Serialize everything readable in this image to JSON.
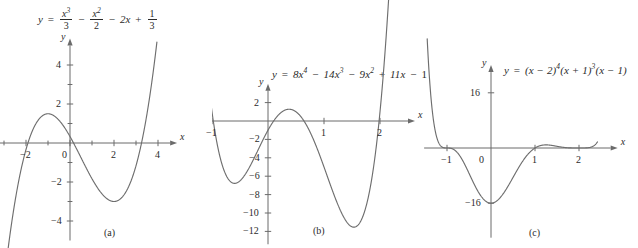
{
  "figure": {
    "background_color": "#ffffff",
    "curve_color": "#6e6e6e",
    "axis_color": "#6b6b6b",
    "text_color": "#2b2b2b"
  },
  "panels": [
    {
      "caption": "(a)",
      "equation_parts": {
        "y": "y",
        "eq": "=",
        "t1_num": "x",
        "t1_exp": "3",
        "t1_den": "3",
        "minus1": "−",
        "t2_num": "x",
        "t2_exp": "2",
        "t2_den": "2",
        "minus2": "−",
        "t3": "2x",
        "plus": "+",
        "t4_num": "1",
        "t4_den": "3"
      },
      "x_axis_label": "x",
      "y_axis_label": "y",
      "x_ticks": [
        "−4",
        "−2",
        "0",
        "2",
        "4"
      ],
      "y_ticks": [
        "4",
        "2",
        "−2",
        "−4"
      ]
    },
    {
      "caption": "(b)",
      "equation_parts": {
        "y": "y",
        "eq": "=",
        "t1": "8x",
        "t1_exp": "4",
        "minus1": "−",
        "t2": "14x",
        "t2_exp": "3",
        "minus2": "−",
        "t3": "9x",
        "t3_exp": "2",
        "plus": "+",
        "t4": "11x",
        "minus3": "−",
        "t5": "1"
      },
      "x_axis_label": "x",
      "y_axis_label": "y",
      "x_ticks": [
        "−1",
        "1",
        "2"
      ],
      "y_ticks": [
        "2",
        "−2",
        "−4",
        "−6",
        "−8",
        "−10",
        "−12"
      ]
    },
    {
      "caption": "(c)",
      "equation_parts": {
        "y": "y",
        "eq": "=",
        "f1": "(x − 2)",
        "f1_exp": "4",
        "f2": "(x + 1)",
        "f2_exp": "3",
        "f3": "(x − 1)"
      },
      "x_axis_label": "x",
      "y_axis_label": "y",
      "x_ticks": [
        "−1",
        "0",
        "1",
        "2"
      ],
      "y_ticks": [
        "16",
        "−16"
      ]
    }
  ],
  "chart_data": [
    {
      "type": "line",
      "title": "y = x³/3 − x²/2 − 2x + 1/3",
      "xlabel": "x",
      "ylabel": "y",
      "xlim": [
        -4.6,
        4.6
      ],
      "ylim": [
        -5.0,
        5.0
      ],
      "grid": false,
      "legend": "none",
      "xticks": [
        -4,
        -2,
        0,
        2,
        4
      ],
      "yticks": [
        4,
        2,
        -2,
        -4
      ],
      "minor_xticks": [
        -3,
        -1,
        1,
        3
      ],
      "minor_yticks": [
        3,
        1,
        -1,
        -3
      ],
      "poly_coeffs_desc": [
        0.3333333,
        -0.5,
        -2.0,
        0.3333333
      ],
      "x_domain_drawn": [
        -3.35,
        3.95
      ],
      "features": {
        "local_max": {
          "x": -1.0,
          "y": 1.5
        },
        "local_min": {
          "x": 2.0,
          "y": -3.0
        }
      }
    },
    {
      "type": "line",
      "title": "y = 8x⁴ − 14x³ − 9x² + 11x − 1",
      "xlabel": "x",
      "ylabel": "y",
      "xlim": [
        -1.25,
        2.55
      ],
      "ylim": [
        -13.5,
        3.5
      ],
      "grid": false,
      "legend": "none",
      "xticks": [
        -1,
        1,
        2
      ],
      "yticks": [
        2,
        -2,
        -4,
        -6,
        -8,
        -10,
        -12
      ],
      "poly_coeffs_desc": [
        8,
        -14,
        -9,
        11,
        -1
      ],
      "x_domain_drawn": [
        -1.12,
        2.22
      ],
      "features": {
        "local_min_left": {
          "x": -0.78,
          "y": -6.7
        },
        "local_max_mid": {
          "x": 0.42,
          "y": 1.45
        },
        "local_min_right": {
          "x": 1.66,
          "y": -11.4
        }
      }
    },
    {
      "type": "line",
      "title": "y = (x − 2)⁴(x + 1)³(x − 1)",
      "xlabel": "x",
      "ylabel": "y",
      "xlim": [
        -1.65,
        2.75
      ],
      "ylim": [
        -26,
        26
      ],
      "grid": false,
      "legend": "none",
      "xticks": [
        -1,
        0,
        1,
        2
      ],
      "yticks": [
        16,
        -16
      ],
      "roots": [
        {
          "x": -1,
          "multiplicity": 3
        },
        {
          "x": 1,
          "multiplicity": 1
        },
        {
          "x": 2,
          "multiplicity": 4
        }
      ],
      "factors": "(x-2)^4 * (x+1)^3 * (x-1)",
      "x_domain_drawn": [
        -1.45,
        2.42
      ],
      "features": {
        "local_min": {
          "x": -0.28,
          "y": -16.0
        },
        "local_max_between": {
          "x": 1.35,
          "y": 1.2
        }
      }
    }
  ]
}
